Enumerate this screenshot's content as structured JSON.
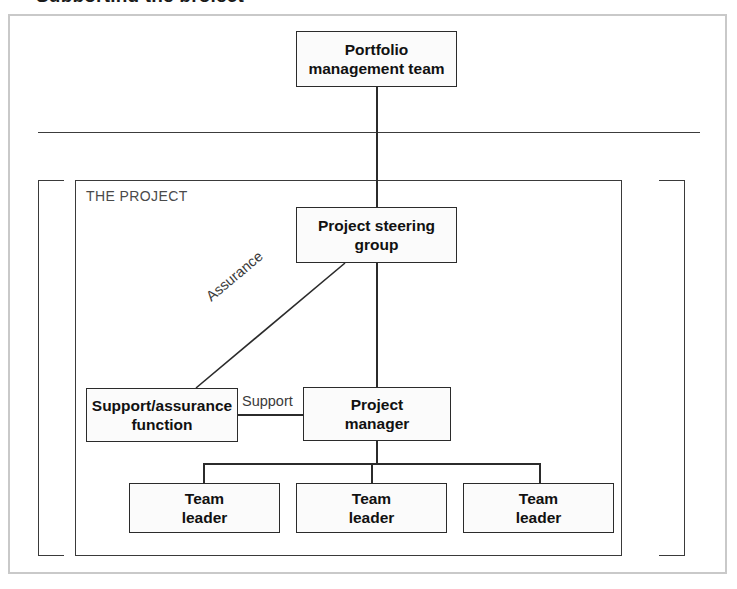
{
  "page": {
    "title_fragment": "Supporting the project"
  },
  "diagram": {
    "container_label": "THE PROJECT",
    "nodes": {
      "portfolio": {
        "line1": "Portfolio",
        "line2": "management team"
      },
      "steering": {
        "line1": "Project steering",
        "line2": "group"
      },
      "support": {
        "line1": "Support/assurance",
        "line2": "function"
      },
      "project_manager": {
        "line1": "Project",
        "line2": "manager"
      },
      "team_leaders": [
        {
          "line1": "Team",
          "line2": "leader"
        },
        {
          "line1": "Team",
          "line2": "leader"
        },
        {
          "line1": "Team",
          "line2": "leader"
        }
      ]
    },
    "edge_labels": {
      "assurance": "Assurance",
      "support": "Support"
    },
    "colors": {
      "node_border": "#2b2b2b",
      "node_fill": "#fbfbfb",
      "connector": "#2b2b2b",
      "frame": "#3a3a3a",
      "outer_frame": "#c9c9c9",
      "label_text": "#3a3a3a",
      "node_text": "#111111"
    }
  }
}
